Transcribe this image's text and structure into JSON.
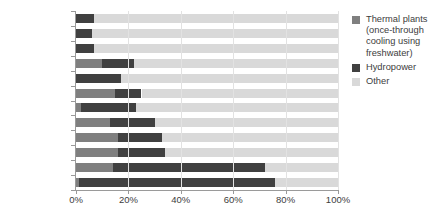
{
  "chart_data": {
    "type": "bar",
    "orientation": "horizontal",
    "stacked": true,
    "title": "",
    "xlabel": "",
    "ylabel": "",
    "xlim": [
      0,
      100
    ],
    "xticks": [
      0,
      20,
      40,
      60,
      80,
      100
    ],
    "xtick_labels": [
      "0%",
      "20%",
      "40%",
      "60%",
      "80%",
      "100%"
    ],
    "grid": true,
    "grid_axis": "x",
    "legend_position": "right",
    "categories": [
      "South Africa",
      "Middle East",
      "United Kingdom",
      "Germany",
      "Japan",
      "United States",
      "China",
      "India",
      "Russia",
      "France",
      "Canada",
      "Brazil"
    ],
    "series": [
      {
        "name": "Thermal plants (once-through cooling using freshwater)",
        "color": "#7f7f7f",
        "values": [
          0,
          0,
          0,
          10,
          0,
          15,
          2,
          13,
          16,
          16,
          14,
          1
        ]
      },
      {
        "name": "Hydropower",
        "color": "#404040",
        "values": [
          7,
          6,
          7,
          12,
          17,
          10,
          21,
          17,
          17,
          18,
          58,
          75
        ]
      },
      {
        "name": "Other",
        "color": "#d9d9d9",
        "values": [
          93,
          94,
          93,
          78,
          83,
          75,
          77,
          70,
          67,
          66,
          28,
          24
        ]
      }
    ]
  },
  "legend": {
    "items": [
      {
        "label": "Thermal plants (once-through cooling using freshwater)",
        "swatch_name": "legend-swatch-thermal",
        "color": "#7f7f7f"
      },
      {
        "label": "Hydropower",
        "swatch_name": "legend-swatch-hydropower",
        "color": "#404040"
      },
      {
        "label": "Other",
        "swatch_name": "legend-swatch-other",
        "color": "#d9d9d9"
      }
    ]
  },
  "colors": {
    "thermal": "#7f7f7f",
    "hydropower": "#404040",
    "other": "#d9d9d9",
    "axis": "#9a9a9a",
    "grid": "#e2e2e2",
    "text": "#3d3d3d",
    "background": "#ffffff"
  }
}
